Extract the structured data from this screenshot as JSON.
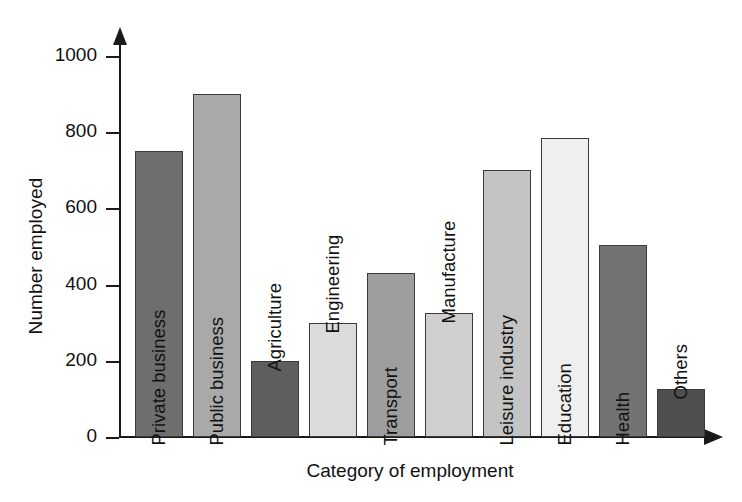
{
  "chart_data": {
    "type": "bar",
    "title": "",
    "xlabel": "Category of employment",
    "ylabel": "Number employed",
    "categories": [
      "Private business",
      "Public business",
      "Agriculture",
      "Engineering",
      "Transport",
      "Manufacture",
      "Leisure industry",
      "Education",
      "Health",
      "Others"
    ],
    "values": [
      750,
      900,
      200,
      300,
      430,
      325,
      700,
      785,
      505,
      125
    ],
    "ylim": [
      0,
      1000
    ],
    "yticks": [
      0,
      200,
      400,
      600,
      800,
      1000
    ],
    "ytick_labels": [
      "0",
      "200",
      "400",
      "600",
      "800",
      "1000"
    ],
    "grid": false,
    "legend": null,
    "bar_colors": [
      "#6e6e6e",
      "#a9a9a9",
      "#5e5e5e",
      "#dcdcdc",
      "#9d9d9d",
      "#cfcfcf",
      "#c4c4c4",
      "#efefef",
      "#737373",
      "#4f4f4f"
    ],
    "bar_border_color": "#3a3a3a",
    "axis_color": "#1a1a1a",
    "background": "#ffffff"
  },
  "axis": {
    "y_title": "Number employed",
    "x_title": "Category of employment"
  }
}
